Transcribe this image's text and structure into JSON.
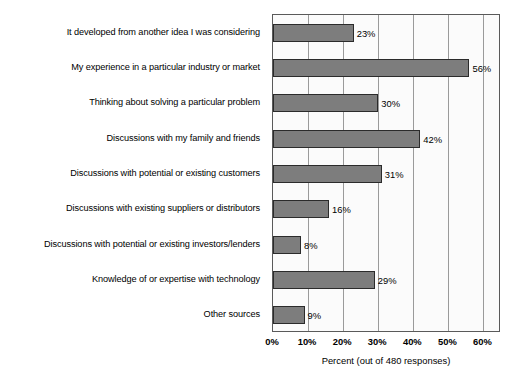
{
  "chart_data": {
    "type": "bar",
    "orientation": "horizontal",
    "title": "",
    "xlabel": "Percent (out of 480 responses)",
    "ylabel": "",
    "xlim": [
      0,
      65
    ],
    "grid": true,
    "legend": false,
    "xticks": [
      "0%",
      "10%",
      "20%",
      "30%",
      "40%",
      "50%",
      "60%"
    ],
    "xtick_values": [
      0,
      10,
      20,
      30,
      40,
      50,
      60
    ],
    "categories": [
      "It developed from another idea I was considering",
      "My experience in a particular industry or market",
      "Thinking about solving a particular problem",
      "Discussions with my family and friends",
      "Discussions with potential or existing customers",
      "Discussions with existing suppliers or distributors",
      "Discussions with potential or existing investors/lenders",
      "Knowledge of or expertise with technology",
      "Other sources"
    ],
    "values": [
      23,
      56,
      30,
      42,
      31,
      16,
      8,
      29,
      9
    ],
    "value_labels": [
      "23%",
      "56%",
      "30%",
      "42%",
      "31%",
      "16%",
      "8%",
      "29%",
      "9%"
    ],
    "bar_color": "#7d7d7d",
    "bar_edge_color": "#2b2b2b",
    "grid_color": "#9a9a9a",
    "frame_color": "#5a5a5a",
    "plot_background": "#fbfbfb",
    "total_responses": 480
  }
}
